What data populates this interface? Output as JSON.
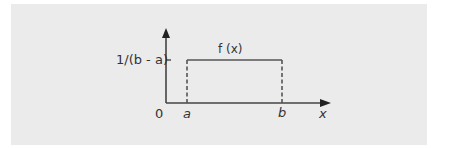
{
  "diagram": {
    "function_label": "f (x)",
    "y_tick_label": "1/(b - a)",
    "origin_label": "0",
    "x_axis_label": "x",
    "x_markers": [
      "a",
      "b"
    ],
    "colors": {
      "background": "#ebebeb",
      "line": "#444444",
      "text": "#333333"
    }
  }
}
